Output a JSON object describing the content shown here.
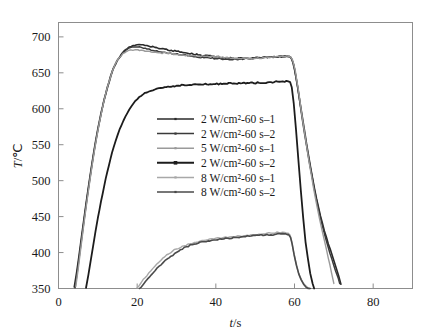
{
  "figure": {
    "background": "#ffffff",
    "frame_color": "#8d8d8d"
  },
  "chart_data": {
    "type": "line",
    "title": "",
    "xlabel": "t/s",
    "ylabel": "T/℃",
    "xlim": [
      0,
      90
    ],
    "ylim": [
      350,
      720
    ],
    "xticks": [
      0,
      20,
      40,
      60,
      80
    ],
    "yticks": [
      350,
      400,
      450,
      500,
      550,
      600,
      650,
      700
    ],
    "xtick_labels": [
      "0",
      "20",
      "40",
      "60",
      "80"
    ],
    "ytick_labels": [
      "350",
      "400",
      "450",
      "500",
      "550",
      "600",
      "650",
      "700"
    ],
    "grid": false,
    "legend_position": "center",
    "series": [
      {
        "name": "2 W/cm²-60 s–1",
        "color": "#2a2a2a",
        "width": 1.6,
        "x": [
          4.0,
          4.6,
          5.2,
          5.8,
          6.4,
          7.0,
          7.6,
          8.2,
          8.8,
          9.4,
          10.0,
          10.8,
          11.6,
          12.4,
          13.2,
          14.0,
          15.0,
          16.0,
          17.0,
          18.0,
          19.0,
          20.0,
          21.0,
          22.0,
          23.0,
          25.0,
          27.0,
          30.0,
          33.0,
          36.0,
          39.0,
          42.0,
          45.0,
          48.0,
          51.0,
          54.0,
          57.0,
          58.6,
          59.0,
          59.4,
          60.0,
          60.8,
          61.6,
          62.6,
          63.6,
          64.6,
          65.6,
          66.6,
          67.6,
          68.6,
          69.6,
          70.4,
          71.2,
          71.8
        ],
        "y": [
          352,
          372,
          395,
          420,
          444,
          468,
          491,
          513,
          534,
          554,
          572,
          594,
          613,
          630,
          645,
          657,
          668,
          676,
          682,
          686,
          688,
          689,
          689,
          688,
          687,
          685,
          683,
          680,
          677,
          675,
          673,
          671,
          670,
          670,
          671,
          672,
          673,
          673,
          672,
          668,
          655,
          630,
          602,
          568,
          534,
          503,
          475,
          451,
          430,
          412,
          396,
          382,
          368,
          356
        ]
      },
      {
        "name": "2 W/cm²-60 s–2",
        "color": "#3a3a3a",
        "width": 1.5,
        "x": [
          4.2,
          4.8,
          5.4,
          6.0,
          6.6,
          7.2,
          7.8,
          8.4,
          9.0,
          9.6,
          10.2,
          11.0,
          11.8,
          12.6,
          13.4,
          14.2,
          15.2,
          16.2,
          17.2,
          18.2,
          19.2,
          20.2,
          21.2,
          22.5,
          24.0,
          26.0,
          28.0,
          31.0,
          34.0,
          37.0,
          40.0,
          43.0,
          46.0,
          49.0,
          52.0,
          55.0,
          57.5,
          58.8,
          59.2,
          59.8,
          60.4,
          61.2,
          62.0,
          63.0,
          64.0,
          65.0,
          66.0,
          67.0,
          68.0,
          69.0,
          70.0,
          70.8,
          71.5
        ],
        "y": [
          351,
          374,
          399,
          424,
          449,
          473,
          496,
          518,
          539,
          558,
          576,
          597,
          616,
          632,
          647,
          659,
          669,
          677,
          682,
          685,
          686,
          686,
          685,
          683,
          681,
          679,
          677,
          675,
          673,
          671,
          670,
          669,
          669,
          670,
          671,
          672,
          672,
          672,
          670,
          662,
          643,
          616,
          585,
          551,
          519,
          489,
          463,
          439,
          418,
          399,
          382,
          369,
          357
        ]
      },
      {
        "name": "5 W/cm²-60 s–1",
        "color": "#9a9a9a",
        "width": 1.4,
        "x": [
          4.4,
          5.0,
          5.6,
          6.2,
          6.8,
          7.4,
          8.0,
          8.6,
          9.2,
          9.8,
          10.4,
          11.2,
          12.0,
          12.8,
          13.6,
          14.4,
          15.4,
          16.4,
          17.4,
          18.4,
          19.4,
          20.6,
          22.0,
          23.5,
          25.5,
          28.0,
          31.0,
          34.0,
          37.0,
          40.0,
          43.0,
          46.0,
          49.0,
          52.0,
          55.0,
          57.0,
          58.4,
          59.0,
          59.5,
          60.2,
          61.0,
          61.8,
          62.8,
          63.8,
          64.8,
          65.8,
          66.8,
          67.8,
          68.6,
          69.4,
          70.0
        ],
        "y": [
          353,
          377,
          403,
          429,
          454,
          478,
          501,
          523,
          544,
          563,
          581,
          602,
          621,
          637,
          651,
          662,
          671,
          677,
          680,
          682,
          682,
          681,
          680,
          679,
          678,
          677,
          675,
          674,
          673,
          672,
          671,
          670,
          670,
          671,
          672,
          673,
          673,
          672,
          668,
          653,
          626,
          594,
          558,
          523,
          491,
          462,
          436,
          412,
          392,
          372,
          357
        ]
      },
      {
        "name": "2 W/cm²-60 s–2",
        "color": "#1c1c1c",
        "width": 1.8,
        "x": [
          7.0,
          7.6,
          8.2,
          8.8,
          9.4,
          10.0,
          10.8,
          11.6,
          12.4,
          13.2,
          14.0,
          15.0,
          16.0,
          17.0,
          18.0,
          19.0,
          20.0,
          21.5,
          23.0,
          25.0,
          27.0,
          30.0,
          33.0,
          36.0,
          39.0,
          42.0,
          45.0,
          48.0,
          51.0,
          54.0,
          57.0,
          58.4,
          58.9,
          59.3,
          59.8,
          60.4,
          61.0,
          61.6,
          62.2,
          62.8,
          63.4,
          64.0,
          64.6,
          65.0
        ],
        "y": [
          351,
          369,
          389,
          409,
          429,
          448,
          471,
          492,
          512,
          530,
          546,
          563,
          577,
          589,
          599,
          607,
          613,
          620,
          624,
          628,
          630,
          632,
          633,
          634,
          634,
          635,
          635,
          636,
          636,
          637,
          638,
          638,
          637,
          630,
          608,
          570,
          528,
          487,
          449,
          415,
          392,
          371,
          357,
          350
        ]
      },
      {
        "name": "8 W/cm²-60 s–1",
        "color": "#a8a8a8",
        "width": 1.4,
        "x": [
          20.0,
          21.0,
          22.0,
          23.0,
          24.0,
          25.0,
          26.0,
          27.0,
          28.0,
          29.0,
          30.0,
          31.5,
          33.0,
          34.5,
          36.0,
          38.0,
          40.0,
          42.0,
          44.0,
          46.0,
          48.0,
          50.0,
          52.0,
          54.0,
          56.0,
          57.5,
          58.4,
          58.9,
          59.3,
          59.8,
          60.4,
          61.0,
          61.6,
          62.2,
          62.8,
          63.4,
          63.9
        ],
        "y": [
          351,
          358,
          365,
          372,
          378,
          384,
          389,
          394,
          398,
          402,
          405,
          409,
          412,
          414,
          416,
          418,
          420,
          421,
          422,
          423,
          424,
          425,
          426,
          427,
          428,
          428,
          427,
          424,
          415,
          400,
          385,
          372,
          364,
          358,
          354,
          351,
          350
        ]
      },
      {
        "name": "8 W/cm²-60 s–2",
        "color": "#4a4a4a",
        "width": 1.6,
        "x": [
          20.6,
          21.6,
          22.6,
          23.6,
          24.6,
          25.6,
          26.6,
          27.6,
          28.6,
          29.6,
          31.0,
          32.5,
          34.0,
          35.5,
          37.0,
          39.0,
          41.0,
          43.0,
          45.0,
          47.0,
          49.0,
          51.0,
          53.0,
          55.0,
          56.5,
          57.8,
          58.5,
          59.0,
          59.4,
          59.9,
          60.5,
          61.1,
          61.7,
          62.3,
          62.9,
          63.5,
          64.0
        ],
        "y": [
          350,
          356,
          363,
          369,
          375,
          381,
          386,
          391,
          395,
          399,
          404,
          408,
          411,
          413,
          415,
          417,
          419,
          420,
          421,
          422,
          423,
          424,
          425,
          425,
          426,
          426,
          425,
          421,
          412,
          397,
          382,
          370,
          362,
          356,
          352,
          350,
          350
        ]
      }
    ]
  },
  "axes": {
    "y_title_symbol": "T",
    "y_title_unit": "/℃",
    "x_title_symbol": "t",
    "x_title_unit": "/s"
  },
  "legend": {
    "entries": [
      {
        "label": "2 W/cm²-60 s–1",
        "color": "#2a2a2a",
        "marker": "small-dot"
      },
      {
        "label": "2 W/cm²-60 s–2",
        "color": "#3a3a3a",
        "marker": "small-dot"
      },
      {
        "label": "5 W/cm²-60 s–1",
        "color": "#9a9a9a",
        "marker": "small-dot"
      },
      {
        "label": "2 W/cm²-60 s–2",
        "color": "#1c1c1c",
        "marker": "square-dot"
      },
      {
        "label": "8 W/cm²-60 s–1",
        "color": "#a8a8a8",
        "marker": "small-dot"
      },
      {
        "label": "8 W/cm²-60 s–2",
        "color": "#4a4a4a",
        "marker": "small-dot"
      }
    ]
  }
}
